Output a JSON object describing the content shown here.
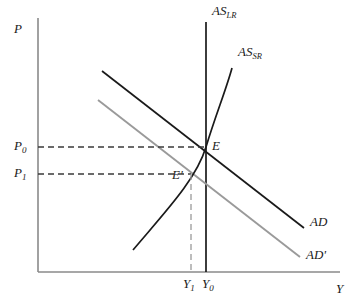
{
  "figure": {
    "type": "economics-diagram",
    "name": "AD-AS model: aggregate demand shift",
    "background": "#ffffff"
  },
  "axes": {
    "y_axis_label": "P",
    "x_axis_label": "Y",
    "origin": {
      "x": 38,
      "y": 272
    },
    "x_end": 340,
    "y_top": 18,
    "color": "#8a8a8a"
  },
  "curves": {
    "as_lr": {
      "label_base": "AS",
      "label_sub": "LR",
      "color": "#1a1a1a",
      "x": 206,
      "y_top": 22,
      "y_bottom": 272,
      "label_pos": {
        "x": 212,
        "y": 10
      }
    },
    "as_sr": {
      "label_base": "AS",
      "label_sub": "SR",
      "color": "#1a1a1a",
      "path": "M 133 250 C 165 212, 196 180, 206 147 C 216 114, 226 90, 232 68",
      "label_pos": {
        "x": 238,
        "y": 50
      }
    },
    "ad": {
      "label": "AD",
      "color": "#1a1a1a",
      "x1": 102,
      "y1": 71,
      "x2": 304,
      "y2": 228,
      "label_pos": {
        "x": 310,
        "y": 221
      }
    },
    "ad_prime": {
      "label": "AD'",
      "color": "#9a9a9a",
      "x1": 98,
      "y1": 100,
      "x2": 300,
      "y2": 257,
      "label_pos": {
        "x": 306,
        "y": 252
      }
    }
  },
  "prices": {
    "p0": {
      "label_base": "P",
      "label_sub": "0",
      "y": 147,
      "x_label": 14,
      "dash_x_end": 206
    },
    "p1": {
      "label_base": "P",
      "label_sub": "1",
      "y": 174,
      "x_label": 14,
      "dash_x_end": 191
    }
  },
  "outputs": {
    "y1": {
      "label_base": "Y",
      "label_sub": "1",
      "x": 191,
      "label_pos": {
        "x": 183,
        "y": 277
      },
      "dash_y_top": 174
    },
    "y0": {
      "label_base": "Y",
      "label_sub": "0",
      "x": 206,
      "label_pos": {
        "x": 202,
        "y": 277
      }
    }
  },
  "equilibria": {
    "e": {
      "label": "E",
      "x": 206,
      "y": 147,
      "label_pos": {
        "x": 212,
        "y": 141
      }
    },
    "e_prime": {
      "label": "E'",
      "x": 191,
      "y": 174,
      "label_pos": {
        "x": 172,
        "y": 172
      }
    }
  },
  "colors": {
    "dark": "#1a1a1a",
    "gray": "#9a9a9a",
    "axis": "#8a8a8a",
    "dash": "#3a3a3a",
    "dash_gray": "#9a9a9a"
  }
}
